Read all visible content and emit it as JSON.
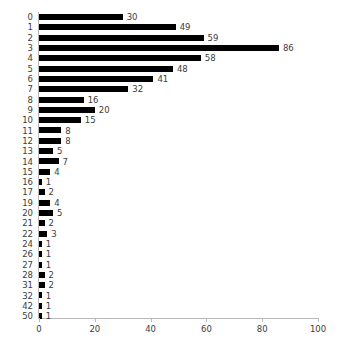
{
  "chart_data": {
    "type": "bar",
    "orientation": "horizontal",
    "title": "",
    "subtitle": "",
    "xlabel": "",
    "ylabel": "",
    "categories": [
      "0",
      "1",
      "2",
      "3",
      "4",
      "5",
      "6",
      "7",
      "8",
      "9",
      "10",
      "11",
      "12",
      "13",
      "14",
      "15",
      "16",
      "17",
      "19",
      "20",
      "21",
      "22",
      "24",
      "26",
      "27",
      "28",
      "31",
      "32",
      "42",
      "50"
    ],
    "values": [
      30,
      49,
      59,
      86,
      58,
      48,
      41,
      32,
      16,
      20,
      15,
      8,
      8,
      5,
      7,
      4,
      1,
      2,
      4,
      5,
      2,
      3,
      1,
      1,
      1,
      2,
      2,
      1,
      1,
      1
    ],
    "data_labels": [
      "30",
      "49",
      "59",
      "86",
      "58",
      "48",
      "41",
      "32",
      "16",
      "20",
      "15",
      "8",
      "8",
      "5",
      "7",
      "4",
      "1",
      "2",
      "4",
      "5",
      "2",
      "3",
      "1",
      "1",
      "1",
      "2",
      "2",
      "1",
      "1",
      "1"
    ],
    "xlim": [
      0,
      100
    ],
    "xticks": [
      0,
      20,
      40,
      60,
      80,
      100
    ],
    "xtick_labels": [
      "0",
      "20",
      "40",
      "60",
      "80",
      "100"
    ],
    "grid": false,
    "legend": null,
    "bar_color": "#000000",
    "axis_color": "#b8b8b8",
    "text_color": "#3c3c3c",
    "background": "#ffffff"
  }
}
